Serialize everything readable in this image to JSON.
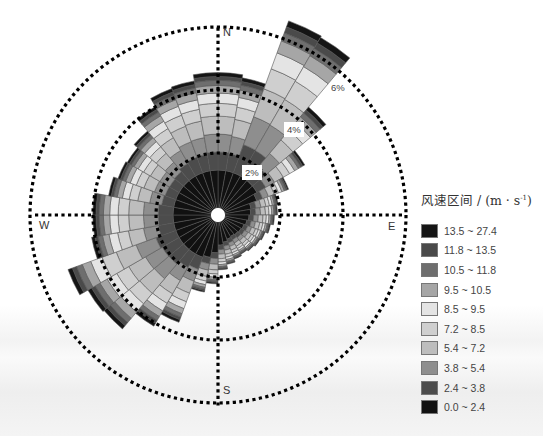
{
  "chart_data": {
    "type": "windrose",
    "title": "",
    "legend_title": "风速区间 / (m · s⁻¹)",
    "directions": [
      "N",
      "E",
      "S",
      "W"
    ],
    "radial_ticks": [
      "2%",
      "4%",
      "6%"
    ],
    "sector_count": 36,
    "sector_width_deg": 10,
    "speed_bins": [
      {
        "label": "13.5 ~ 27.4",
        "color": "#151515"
      },
      {
        "label": "11.8 ~ 13.5",
        "color": "#4a4a4a"
      },
      {
        "label": "10.5 ~ 11.8",
        "color": "#6e6e6e"
      },
      {
        "label": "9.5 ~ 10.5",
        "color": "#a6a6a6"
      },
      {
        "label": "8.5 ~ 9.5",
        "color": "#e4e4e4"
      },
      {
        "label": "7.2 ~ 8.5",
        "color": "#cfcfcf"
      },
      {
        "label": "5.4 ~ 7.2",
        "color": "#bdbdbd"
      },
      {
        "label": "3.8 ~ 5.4",
        "color": "#8e8e8e"
      },
      {
        "label": "2.4 ~ 3.8",
        "color": "#4c4c4c"
      },
      {
        "label": "0.0 ~ 2.4",
        "color": "#111111"
      }
    ],
    "sector_total_pct": [
      4.55,
      4.45,
      6.6,
      6.55,
      4.5,
      3.2,
      2.4,
      1.95,
      1.9,
      1.8,
      1.7,
      1.6,
      1.55,
      1.5,
      1.45,
      1.5,
      1.6,
      1.75,
      2.2,
      2.5,
      3.65,
      4.1,
      4.75,
      4.8,
      5.1,
      4.1,
      4.0,
      4.0,
      3.55,
      3.4,
      3.35,
      3.5,
      4.0,
      4.3,
      4.35,
      4.55
    ]
  },
  "labels": {
    "north": "N",
    "east": "E",
    "south": "S",
    "west": "W",
    "ring_2": "2%",
    "ring_4": "4%",
    "ring_6": "6%"
  },
  "legend": {
    "title_main": "风速区间 / (m · s",
    "title_sup": "-1",
    "title_end": ")",
    "items": [
      {
        "label": "13.5 ~ 27.4",
        "color": "#151515"
      },
      {
        "label": "11.8 ~ 13.5",
        "color": "#4a4a4a"
      },
      {
        "label": "10.5 ~ 11.8",
        "color": "#6e6e6e"
      },
      {
        "label": "9.5 ~ 10.5",
        "color": "#a6a6a6"
      },
      {
        "label": "8.5 ~ 9.5",
        "color": "#e4e4e4"
      },
      {
        "label": "7.2 ~ 8.5",
        "color": "#cfcfcf"
      },
      {
        "label": "5.4 ~ 7.2",
        "color": "#bdbdbd"
      },
      {
        "label": "3.8 ~ 5.4",
        "color": "#8e8e8e"
      },
      {
        "label": "2.4 ~ 3.8",
        "color": "#4c4c4c"
      },
      {
        "label": "0.0 ~ 2.4",
        "color": "#111111"
      }
    ]
  }
}
